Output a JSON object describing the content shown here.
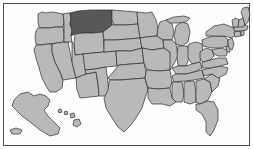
{
  "figure": {
    "title": "United States map with Montana highlighted",
    "type": "choropleth-locator-map",
    "region": "United States of America",
    "background_color": "#ffffff",
    "frame_color": "#4a4a4a",
    "canvas_color": "#fdfdfd",
    "width": 253,
    "height": 149
  },
  "legend": {
    "default_fill": "#b9b9b9",
    "highlight_fill": "#585858",
    "border_color": "#2e2e2e",
    "default_label": "Other states",
    "highlight_label": "Montana (highlighted)"
  },
  "map_data": {
    "type": "map",
    "projection": "composite-albers-usa",
    "highlighted": [
      "Montana"
    ],
    "insets": [
      "Alaska",
      "Hawaii"
    ],
    "states": [
      {
        "name": "Washington",
        "highlighted": false
      },
      {
        "name": "Oregon",
        "highlighted": false
      },
      {
        "name": "California",
        "highlighted": false
      },
      {
        "name": "Nevada",
        "highlighted": false
      },
      {
        "name": "Idaho",
        "highlighted": false
      },
      {
        "name": "Montana",
        "highlighted": true
      },
      {
        "name": "Wyoming",
        "highlighted": false
      },
      {
        "name": "Utah",
        "highlighted": false
      },
      {
        "name": "Arizona",
        "highlighted": false
      },
      {
        "name": "Colorado",
        "highlighted": false
      },
      {
        "name": "New Mexico",
        "highlighted": false
      },
      {
        "name": "North Dakota",
        "highlighted": false
      },
      {
        "name": "South Dakota",
        "highlighted": false
      },
      {
        "name": "Nebraska",
        "highlighted": false
      },
      {
        "name": "Kansas",
        "highlighted": false
      },
      {
        "name": "Oklahoma",
        "highlighted": false
      },
      {
        "name": "Texas",
        "highlighted": false
      },
      {
        "name": "Minnesota",
        "highlighted": false
      },
      {
        "name": "Iowa",
        "highlighted": false
      },
      {
        "name": "Missouri",
        "highlighted": false
      },
      {
        "name": "Arkansas",
        "highlighted": false
      },
      {
        "name": "Louisiana",
        "highlighted": false
      },
      {
        "name": "Wisconsin",
        "highlighted": false
      },
      {
        "name": "Illinois",
        "highlighted": false
      },
      {
        "name": "Michigan",
        "highlighted": false
      },
      {
        "name": "Indiana",
        "highlighted": false
      },
      {
        "name": "Ohio",
        "highlighted": false
      },
      {
        "name": "Kentucky",
        "highlighted": false
      },
      {
        "name": "Tennessee",
        "highlighted": false
      },
      {
        "name": "Mississippi",
        "highlighted": false
      },
      {
        "name": "Alabama",
        "highlighted": false
      },
      {
        "name": "Georgia",
        "highlighted": false
      },
      {
        "name": "Florida",
        "highlighted": false
      },
      {
        "name": "South Carolina",
        "highlighted": false
      },
      {
        "name": "North Carolina",
        "highlighted": false
      },
      {
        "name": "Virginia",
        "highlighted": false
      },
      {
        "name": "West Virginia",
        "highlighted": false
      },
      {
        "name": "Maryland",
        "highlighted": false
      },
      {
        "name": "Delaware",
        "highlighted": false
      },
      {
        "name": "Pennsylvania",
        "highlighted": false
      },
      {
        "name": "New Jersey",
        "highlighted": false
      },
      {
        "name": "New York",
        "highlighted": false
      },
      {
        "name": "Connecticut",
        "highlighted": false
      },
      {
        "name": "Rhode Island",
        "highlighted": false
      },
      {
        "name": "Massachusetts",
        "highlighted": false
      },
      {
        "name": "Vermont",
        "highlighted": false
      },
      {
        "name": "New Hampshire",
        "highlighted": false
      },
      {
        "name": "Maine",
        "highlighted": false
      },
      {
        "name": "Alaska",
        "highlighted": false
      },
      {
        "name": "Hawaii",
        "highlighted": false
      }
    ]
  }
}
